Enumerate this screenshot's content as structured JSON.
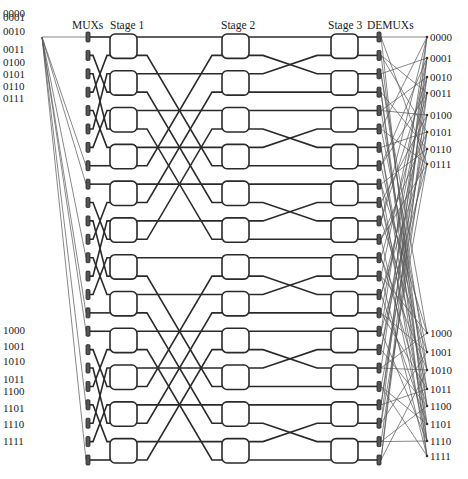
{
  "headers": {
    "muxs": "MUXs",
    "stage1": "Stage 1",
    "stage2": "Stage 2",
    "stage3": "Stage 3",
    "demuxs": "DEMUXs"
  },
  "inputs": [
    "0000",
    "0001",
    "0010",
    "0011",
    "0100",
    "0101",
    "0110",
    "0111",
    "1000",
    "1001",
    "1010",
    "1011",
    "1100",
    "1101",
    "1110",
    "1111"
  ],
  "outputs": [
    "0000",
    "0001",
    "0010",
    "0011",
    "0100",
    "0101",
    "0110",
    "0111",
    "1000",
    "1001",
    "1010",
    "1011",
    "1100",
    "1101",
    "1110",
    "1111"
  ],
  "input_label_y": [
    13,
    17,
    31,
    49,
    62,
    74,
    86,
    98,
    330,
    346,
    361,
    379,
    391,
    408,
    424,
    441
  ],
  "output_label_y": [
    37,
    58,
    77,
    93,
    115,
    132,
    149,
    164,
    333,
    352,
    370,
    389,
    406,
    424,
    441,
    456
  ],
  "network": {
    "mux_count": 24,
    "nodes_per_stage": 12,
    "stages": 3,
    "demux_count": 24,
    "colors": {
      "wire": "#2a2a2a",
      "thin_wire": "#555555",
      "node_fill": "#ffffff",
      "bar": "#555555"
    }
  }
}
